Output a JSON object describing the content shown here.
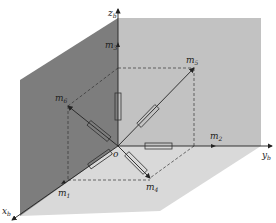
{
  "diagram": {
    "axes": {
      "x": {
        "label": "x",
        "sub": "b"
      },
      "y": {
        "label": "y",
        "sub": "b"
      },
      "z": {
        "label": "z",
        "sub": "b"
      }
    },
    "origin_label": "o",
    "vectors": [
      {
        "label": "m",
        "sub": "1"
      },
      {
        "label": "m",
        "sub": "2"
      },
      {
        "label": "m",
        "sub": "3"
      },
      {
        "label": "m",
        "sub": "4"
      },
      {
        "label": "m",
        "sub": "5"
      },
      {
        "label": "m",
        "sub": "6"
      }
    ],
    "colors": {
      "side_wall": "#7a7a7a",
      "back_wall": "#bdbdbd",
      "floor": "#d6d6d6",
      "line": "#222222"
    }
  }
}
